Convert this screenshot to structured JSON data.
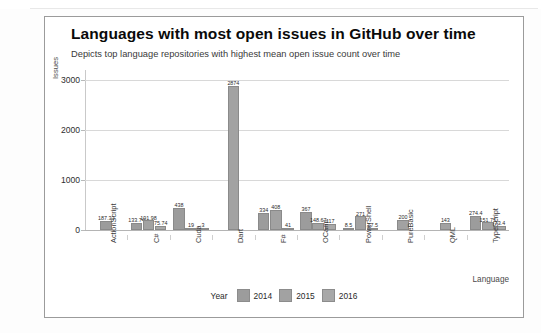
{
  "chart_data": {
    "type": "bar",
    "title": "Languages with most open issues in GitHub over time",
    "subtitle": "Depicts top language repositories with highest mean open issue count over time",
    "xlabel": "Language",
    "ylabel": "Issues",
    "ylim": [
      0,
      3200
    ],
    "yticks": [
      0,
      1000,
      2000,
      3000
    ],
    "ytick_labels": [
      "0",
      "1000",
      "2000",
      "3000"
    ],
    "grid": true,
    "legend_position": "bottom",
    "legend_title": "Year",
    "categories": [
      "ActionScript",
      "C#",
      "Cuda",
      "Dart",
      "F#",
      "OCaml",
      "PowerShell",
      "PureBasic",
      "QML",
      "TypeScript"
    ],
    "series": [
      {
        "name": "2014",
        "color": "#9c9c9c",
        "values": [
          187.33,
          133.74,
          438,
          null,
          334,
          367,
          8.5,
          null,
          null,
          274.4
        ],
        "labels": [
          "187.33",
          "133.74",
          "438",
          "",
          "334",
          "367",
          "8.5",
          "",
          "",
          "274.4"
        ]
      },
      {
        "name": "2015",
        "color": "#a2a2a2",
        "values": [
          null,
          191.98,
          19,
          2874,
          408,
          148.67,
          271,
          200,
          143,
          151.75
        ],
        "labels": [
          "",
          "191.98",
          "19",
          "2874",
          "408",
          "148.67",
          "271",
          "200",
          "143",
          "151.75"
        ]
      },
      {
        "name": "2016",
        "color": "#a8a8a8",
        "values": [
          null,
          75.74,
          3,
          null,
          41,
          117,
          17.5,
          null,
          null,
          73.4
        ],
        "labels": [
          "",
          "75.74",
          "3",
          "",
          "41",
          "117",
          "17.5",
          "",
          "",
          "73.4"
        ]
      }
    ]
  }
}
